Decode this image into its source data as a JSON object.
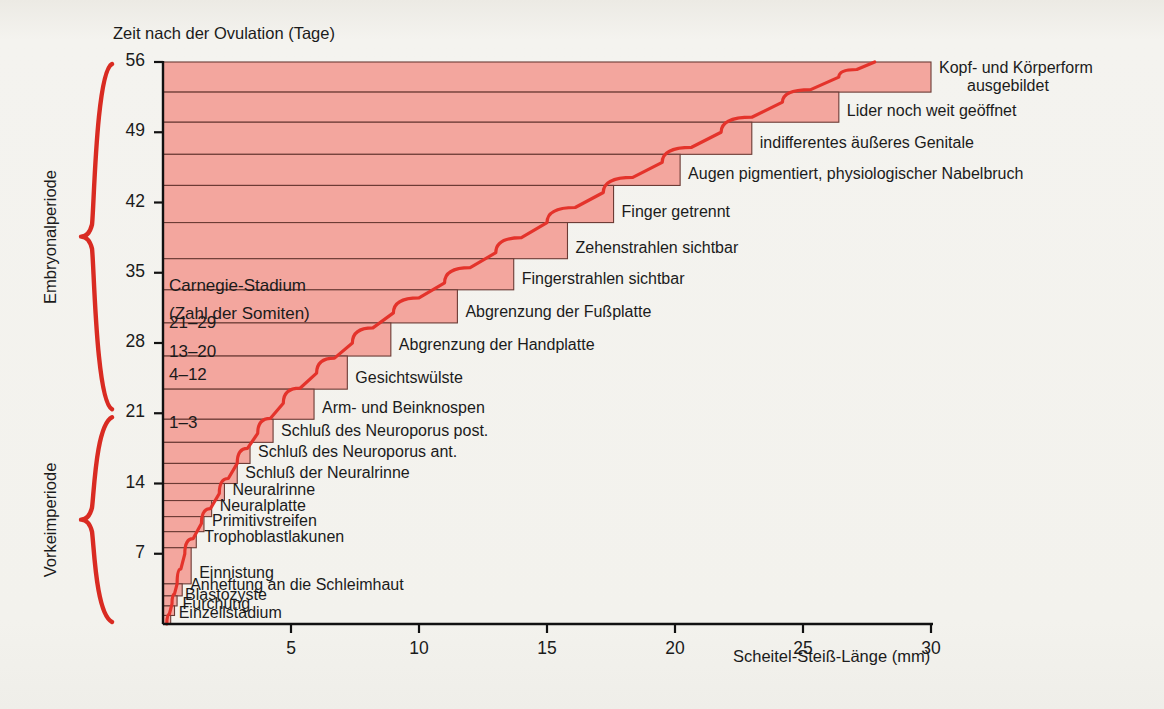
{
  "figure": {
    "background_color": "#f2f1ec",
    "band_fill": "#f3a69e",
    "band_stroke": "#6b3b35",
    "curve_color": "#e4332b",
    "bracket_color": "#d92b22",
    "text_color": "#1b1b1b"
  },
  "axes": {
    "y_axis_title": "Zeit nach der Ovulation (Tage)",
    "y_ticks": [
      56,
      49,
      42,
      35,
      28,
      21,
      14,
      7
    ],
    "y_unit": "Tage",
    "y_range": [
      0,
      56
    ],
    "x_axis_title": "Scheitel-Steiß-Länge (mm)",
    "x_ticks": [
      5,
      10,
      15,
      20,
      25,
      30
    ],
    "x_unit": "mm",
    "x_range": [
      0,
      30
    ]
  },
  "periods": [
    {
      "label": "Embryonalperiode",
      "from_day": 21,
      "to_day": 56
    },
    {
      "label": "Vorkeimperiode",
      "from_day": 0,
      "to_day": 21
    }
  ],
  "stage_box": {
    "line1": "Carnegie-Stadium",
    "line2": "(Zahl der Somiten)"
  },
  "somite_labels": [
    {
      "text": "21–29",
      "day_top": 31.5,
      "day_bottom": 28.3
    },
    {
      "text": "13–20",
      "day_top": 28.3,
      "day_bottom": 25.8
    },
    {
      "text": "4–12",
      "day_top": 25.8,
      "day_bottom": 23.6
    },
    {
      "text": "1–3",
      "day_top": 21.0,
      "day_bottom": 18.8
    }
  ],
  "chart_data": {
    "type": "bar",
    "orientation": "horizontal",
    "xlabel": "Scheitel-Steiß-Länge (mm)",
    "ylabel": "Zeit nach der Ovulation (Tage)",
    "xlim": [
      0,
      30
    ],
    "ylim": [
      0,
      56
    ],
    "grid": false,
    "legend": "none",
    "note": "Jede Stufe ist ein Entwicklungsereignis; Balkenlänge = Scheitel-Steiß-Länge (mm), Balkenhöhe = Zeitspanne (Tage nach Ovulation).",
    "bands": [
      {
        "label": "Kopf- und Körperform\nausgebildet",
        "label_line1": "Kopf- und Körperform",
        "label_line2": "ausgebildet",
        "day_top": 56.0,
        "day_bottom": 53.0,
        "crl_mm": 30.0
      },
      {
        "label": "Lider noch weit geöffnet",
        "day_top": 53.0,
        "day_bottom": 50.0,
        "crl_mm": 26.4
      },
      {
        "label": "indifferentes äußeres Genitale",
        "day_top": 50.0,
        "day_bottom": 46.8,
        "crl_mm": 23.0
      },
      {
        "label": "Augen pigmentiert, physiologischer Nabelbruch",
        "day_top": 46.8,
        "day_bottom": 43.7,
        "crl_mm": 20.2
      },
      {
        "label": "Finger getrennt",
        "day_top": 43.7,
        "day_bottom": 40.0,
        "crl_mm": 17.6
      },
      {
        "label": "Zehenstrahlen sichtbar",
        "day_top": 40.0,
        "day_bottom": 36.4,
        "crl_mm": 15.8
      },
      {
        "label": "Fingerstrahlen sichtbar",
        "day_top": 36.4,
        "day_bottom": 33.3,
        "crl_mm": 13.7
      },
      {
        "label": "Abgrenzung der Fußplatte",
        "day_top": 33.3,
        "day_bottom": 30.0,
        "crl_mm": 11.5
      },
      {
        "label": "Abgrenzung der Handplatte",
        "day_top": 30.0,
        "day_bottom": 26.7,
        "crl_mm": 8.9
      },
      {
        "label": "Gesichtswülste",
        "day_top": 26.7,
        "day_bottom": 23.4,
        "crl_mm": 7.2
      },
      {
        "label": "Arm- und Beinknospen",
        "day_top": 23.4,
        "day_bottom": 20.4,
        "crl_mm": 5.9
      },
      {
        "label": "Schluß des Neuroporus post.",
        "day_top": 20.4,
        "day_bottom": 18.1,
        "crl_mm": 4.3
      },
      {
        "label": "Schluß des Neuroporus ant.",
        "day_top": 18.1,
        "day_bottom": 16.0,
        "crl_mm": 3.4
      },
      {
        "label": "Schluß der Neuralrinne",
        "day_top": 16.0,
        "day_bottom": 14.0,
        "crl_mm": 2.9
      },
      {
        "label": "Neuralrinne",
        "day_top": 14.0,
        "day_bottom": 12.3,
        "crl_mm": 2.4
      },
      {
        "label": "Neuralplatte",
        "day_top": 12.3,
        "day_bottom": 10.7,
        "crl_mm": 1.9
      },
      {
        "label": "Primitivstreifen",
        "day_top": 10.7,
        "day_bottom": 9.2,
        "crl_mm": 1.6
      },
      {
        "label": "Trophoblastlakunen",
        "day_top": 9.2,
        "day_bottom": 7.6,
        "crl_mm": 1.3
      },
      {
        "label": "Einnistung",
        "day_top": 7.6,
        "day_bottom": 4.0,
        "crl_mm": 1.1
      },
      {
        "label": "Anheftung an die Schleimhaut",
        "day_top": 4.0,
        "day_bottom": 2.8,
        "crl_mm": 0.75
      },
      {
        "label": "Blastozyste",
        "day_top": 2.8,
        "day_bottom": 1.8,
        "crl_mm": 0.55
      },
      {
        "label": "Furchung",
        "day_top": 1.8,
        "day_bottom": 0.85,
        "crl_mm": 0.45
      },
      {
        "label": "Einzellstadium",
        "day_top": 0.85,
        "day_bottom": 0.0,
        "crl_mm": 0.3
      }
    ],
    "growth_curve": {
      "name": "Scheitel-Steiß-Längen-Wachstumskurve",
      "color": "#e4332b",
      "points": [
        {
          "day": 0.0,
          "crl_mm": 0.15
        },
        {
          "day": 2.0,
          "crl_mm": 0.35
        },
        {
          "day": 4.0,
          "crl_mm": 0.55
        },
        {
          "day": 7.0,
          "crl_mm": 0.85
        },
        {
          "day": 10.0,
          "crl_mm": 1.5
        },
        {
          "day": 13.0,
          "crl_mm": 2.2
        },
        {
          "day": 16.0,
          "crl_mm": 2.9
        },
        {
          "day": 19.0,
          "crl_mm": 3.7
        },
        {
          "day": 22.0,
          "crl_mm": 4.7
        },
        {
          "day": 25.0,
          "crl_mm": 6.0
        },
        {
          "day": 28.0,
          "crl_mm": 7.4
        },
        {
          "day": 31.0,
          "crl_mm": 9.0
        },
        {
          "day": 34.0,
          "crl_mm": 11.0
        },
        {
          "day": 37.0,
          "crl_mm": 13.0
        },
        {
          "day": 40.0,
          "crl_mm": 15.0
        },
        {
          "day": 43.0,
          "crl_mm": 17.2
        },
        {
          "day": 46.0,
          "crl_mm": 19.5
        },
        {
          "day": 49.0,
          "crl_mm": 21.8
        },
        {
          "day": 52.0,
          "crl_mm": 24.2
        },
        {
          "day": 54.5,
          "crl_mm": 26.4
        },
        {
          "day": 56.0,
          "crl_mm": 27.8
        }
      ]
    }
  }
}
